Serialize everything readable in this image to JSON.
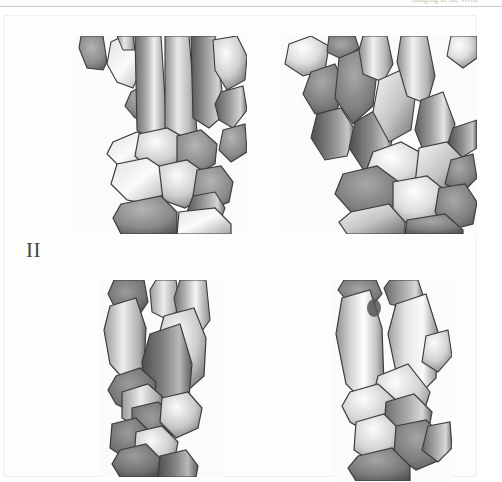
{
  "header": {
    "running_text": "Imaging of the Wrist",
    "rule_color": "#c9c9c9"
  },
  "figure": {
    "label": "II",
    "border_color": "#f0f0f0",
    "background": "#fdfdfd",
    "panels": [
      {
        "name": "panel-top-left",
        "view": "dorsal-palmar view of carpal bones and metacarpal bases, left",
        "position": "top-left"
      },
      {
        "name": "panel-top-right",
        "view": "dorsal-palmar view of carpal bones and metacarpal bases, rotated",
        "position": "top-right"
      },
      {
        "name": "panel-bottom-left",
        "view": "lateral view of distal radius, ulna and carpal bones",
        "position": "bottom-left"
      },
      {
        "name": "panel-bottom-right",
        "view": "lateral view of distal radius, ulna and carpal bones, rotated",
        "position": "bottom-right"
      }
    ]
  },
  "colors": {
    "page_background": "#ffffff",
    "panel_background": "#fbfbfb",
    "bone_light": "#f4f4f4",
    "bone_mid": "#b8b8b8",
    "bone_dark": "#6e6e6e",
    "bone_darkest": "#4a4a4a",
    "bone_outline": "#3c3c3c",
    "label_color": "#454545"
  }
}
